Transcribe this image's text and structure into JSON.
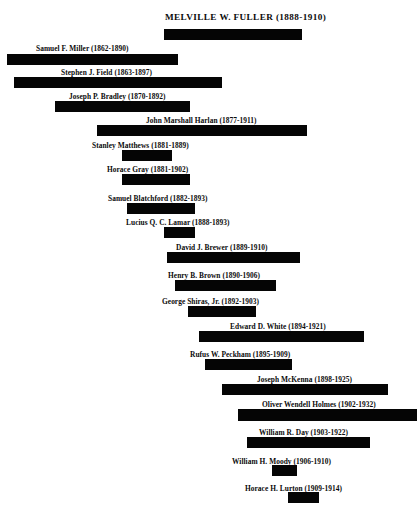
{
  "figure": {
    "type": "timeline-gantt",
    "title": "MELVILLE  W.  FULLER (1888-1910)",
    "background_color": "#ffffff",
    "bar_color": "#050505",
    "text_color": "#0b0b0b"
  },
  "chart_data": {
    "type": "bar",
    "orientation": "horizontal",
    "title": "MELVILLE  W.  FULLER (1888-1910)",
    "xlabel": "",
    "ylabel": "",
    "grid": false,
    "legend": false,
    "axis_visible": false,
    "xlim": [
      1862,
      1932
    ],
    "categories": [
      "MELVILLE  W.  FULLER",
      "Samuel F. Miller",
      "Stephen J. Field",
      "Joseph P. Bradley",
      "John Marshall Harlan",
      "Stanley Matthews",
      "Horace Gray",
      "Samuel Blatchford",
      "Lucius Q. C. Lamar",
      "David J. Brewer",
      "Henry B. Brown",
      "George Shiras, Jr.",
      "Edward D. White",
      "Rufus W. Peckham",
      "Joseph McKenna",
      "Oliver Wendell Holmes",
      "William R. Day",
      "William H. Moody",
      "Horace H. Lurton"
    ],
    "series": [
      {
        "name": "Tenure",
        "spans": [
          {
            "start": 1888,
            "end": 1910
          },
          {
            "start": 1862,
            "end": 1890
          },
          {
            "start": 1863,
            "end": 1897
          },
          {
            "start": 1870,
            "end": 1892
          },
          {
            "start": 1877,
            "end": 1911
          },
          {
            "start": 1881,
            "end": 1889
          },
          {
            "start": 1881,
            "end": 1902
          },
          {
            "start": 1882,
            "end": 1893
          },
          {
            "start": 1888,
            "end": 1893
          },
          {
            "start": 1889,
            "end": 1910
          },
          {
            "start": 1890,
            "end": 1906
          },
          {
            "start": 1892,
            "end": 1903
          },
          {
            "start": 1894,
            "end": 1921
          },
          {
            "start": 1895,
            "end": 1909
          },
          {
            "start": 1898,
            "end": 1925
          },
          {
            "start": 1902,
            "end": 1932
          },
          {
            "start": 1903,
            "end": 1922
          },
          {
            "start": 1906,
            "end": 1910
          },
          {
            "start": 1909,
            "end": 1914
          }
        ]
      }
    ]
  },
  "rows": [
    {
      "id": "fuller",
      "label": "MELVILLE  W.  FULLER (1888-1910)",
      "name": "MELVILLE  W.  FULLER",
      "years": "(1888-1910)",
      "is_title": true,
      "label_x": 165,
      "label_y": 13,
      "bar_x": 164,
      "bar_y": 29,
      "bar_w": 138,
      "bar_h": 11
    },
    {
      "id": "miller",
      "label": "Samuel F. Miller (1862-1890)",
      "name": "Samuel F. Miller",
      "years": "(1862-1890)",
      "is_title": false,
      "label_x": 36,
      "label_y": 44,
      "bar_x": 7,
      "bar_y": 54,
      "bar_w": 171,
      "bar_h": 11
    },
    {
      "id": "field",
      "label": "Stephen J. Field (1863-1897)",
      "name": "Stephen J. Field",
      "years": "(1863-1897)",
      "is_title": false,
      "label_x": 61,
      "label_y": 68,
      "bar_x": 14,
      "bar_y": 77,
      "bar_w": 208,
      "bar_h": 11
    },
    {
      "id": "bradley",
      "label": "Joseph P. Bradley (1870-1892)",
      "name": "Joseph P. Bradley",
      "years": "(1870-1892)",
      "is_title": false,
      "label_x": 69,
      "label_y": 92,
      "bar_x": 55,
      "bar_y": 101,
      "bar_w": 135,
      "bar_h": 11
    },
    {
      "id": "harlan",
      "label": "John Marshall Harlan (1877-1911)",
      "name": "John Marshall Harlan",
      "years": "(1877-1911)",
      "is_title": false,
      "label_x": 146,
      "label_y": 116,
      "bar_x": 97,
      "bar_y": 125,
      "bar_w": 210,
      "bar_h": 11
    },
    {
      "id": "matthews",
      "label": "Stanley Matthews (1881-1889)",
      "name": "Stanley Matthews",
      "years": "(1881-1889)",
      "is_title": false,
      "label_x": 92,
      "label_y": 141,
      "bar_x": 122,
      "bar_y": 150,
      "bar_w": 50,
      "bar_h": 11
    },
    {
      "id": "gray",
      "label": "Horace Gray (1881-1902)",
      "name": "Horace Gray",
      "years": "(1881-1902)",
      "is_title": false,
      "label_x": 107,
      "label_y": 165,
      "bar_x": 122,
      "bar_y": 174,
      "bar_w": 68,
      "bar_h": 11
    },
    {
      "id": "blatchford",
      "label": "Samuel Blatchford (1882-1893)",
      "name": "Samuel Blatchford",
      "years": "(1882-1893)",
      "is_title": false,
      "label_x": 108,
      "label_y": 194,
      "bar_x": 127,
      "bar_y": 203,
      "bar_w": 68,
      "bar_h": 11
    },
    {
      "id": "lamar",
      "label": "Lucius Q. C. Lamar (1888-1893)",
      "name": "Lucius Q. C. Lamar",
      "years": "(1888-1893)",
      "is_title": false,
      "label_x": 126,
      "label_y": 218,
      "bar_x": 164,
      "bar_y": 227,
      "bar_w": 31,
      "bar_h": 11
    },
    {
      "id": "brewer",
      "label": "David J. Brewer (1889-1910)",
      "name": "David J. Brewer",
      "years": "(1889-1910)",
      "is_title": false,
      "label_x": 176,
      "label_y": 243,
      "bar_x": 167,
      "bar_y": 252,
      "bar_w": 133,
      "bar_h": 11
    },
    {
      "id": "brown",
      "label": "Henry B. Brown (1890-1906)",
      "name": "Henry B. Brown",
      "years": "(1890-1906)",
      "is_title": false,
      "label_x": 168,
      "label_y": 271,
      "bar_x": 175,
      "bar_y": 280,
      "bar_w": 101,
      "bar_h": 11
    },
    {
      "id": "shiras",
      "label": "George Shiras, Jr. (1892-1903)",
      "name": "George Shiras, Jr.",
      "years": "(1892-1903)",
      "is_title": false,
      "label_x": 162,
      "label_y": 297,
      "bar_x": 188,
      "bar_y": 306,
      "bar_w": 68,
      "bar_h": 11
    },
    {
      "id": "white",
      "label": "Edward D. White (1894-1921)",
      "name": "Edward D. White",
      "years": "(1894-1921)",
      "is_title": false,
      "label_x": 230,
      "label_y": 322,
      "bar_x": 199,
      "bar_y": 331,
      "bar_w": 165,
      "bar_h": 11
    },
    {
      "id": "peckham",
      "label": "Rufus W. Peckham (1895-1909)",
      "name": "Rufus W. Peckham",
      "years": "(1895-1909)",
      "is_title": false,
      "label_x": 190,
      "label_y": 350,
      "bar_x": 205,
      "bar_y": 359,
      "bar_w": 87,
      "bar_h": 11
    },
    {
      "id": "mckenna",
      "label": "Joseph McKenna (1898-1925)",
      "name": "Joseph McKenna",
      "years": "(1898-1925)",
      "is_title": false,
      "label_x": 257,
      "label_y": 375,
      "bar_x": 222,
      "bar_y": 384,
      "bar_w": 166,
      "bar_h": 11
    },
    {
      "id": "holmes",
      "label": "Oliver Wendell Holmes (1902-1932)",
      "name": "Oliver Wendell Holmes",
      "years": "(1902-1932)",
      "is_title": false,
      "label_x": 262,
      "label_y": 400,
      "bar_x": 238,
      "bar_y": 409,
      "bar_w": 179,
      "bar_h": 12
    },
    {
      "id": "day",
      "label": "William R. Day (1903-1922)",
      "name": "William R. Day",
      "years": "(1903-1922)",
      "is_title": false,
      "label_x": 259,
      "label_y": 428,
      "bar_x": 247,
      "bar_y": 437,
      "bar_w": 123,
      "bar_h": 11
    },
    {
      "id": "moody",
      "label": "William H. Moody (1906-1910)",
      "name": "William H. Moody",
      "years": "(1906-1910)",
      "is_title": false,
      "label_x": 232,
      "label_y": 457,
      "bar_x": 272,
      "bar_y": 465,
      "bar_w": 25,
      "bar_h": 11
    },
    {
      "id": "lurton",
      "label": "Horace H. Lurton (1909-1914)",
      "name": "Horace H. Lurton",
      "years": "(1909-1914)",
      "is_title": false,
      "label_x": 245,
      "label_y": 484,
      "bar_x": 288,
      "bar_y": 492,
      "bar_w": 31,
      "bar_h": 11
    }
  ]
}
